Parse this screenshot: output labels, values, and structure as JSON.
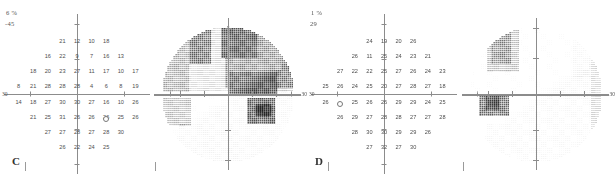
{
  "report": {
    "title": "Humphrey visual field greyscale and numeric threshold panels",
    "axis_label": "30",
    "colors": {
      "axis": "#8c8c8c",
      "text": "#4d4d4d",
      "background": "#ffffff"
    }
  },
  "panels": [
    {
      "id": "C",
      "label": "C",
      "header_percent": "6 %",
      "header_value": "-45",
      "numeric_chart": {
        "type": "table",
        "title": "Numeric threshold sensitivity grid (dB) - panel C",
        "axis_end_label": "30",
        "blind_spot": {
          "col": 6,
          "row": 5
        },
        "rows": [
          {
            "row": 0,
            "cells": [
              {
                "col": 3,
                "v": "21"
              },
              {
                "col": 4,
                "v": "12"
              },
              {
                "col": 5,
                "v": "10"
              },
              {
                "col": 6,
                "v": "18"
              }
            ]
          },
          {
            "row": 1,
            "cells": [
              {
                "col": 2,
                "v": "16"
              },
              {
                "col": 3,
                "v": "22"
              },
              {
                "col": 4,
                "v": "9"
              },
              {
                "col": 5,
                "v": "7"
              },
              {
                "col": 6,
                "v": "16"
              },
              {
                "col": 7,
                "v": "13"
              }
            ]
          },
          {
            "row": 2,
            "cells": [
              {
                "col": 1,
                "v": "18"
              },
              {
                "col": 2,
                "v": "20"
              },
              {
                "col": 3,
                "v": "23"
              },
              {
                "col": 4,
                "v": "27"
              },
              {
                "col": 5,
                "v": "11"
              },
              {
                "col": 6,
                "v": "17"
              },
              {
                "col": 7,
                "v": "10"
              },
              {
                "col": 8,
                "v": "17"
              }
            ]
          },
          {
            "row": 3,
            "cells": [
              {
                "col": 0,
                "v": "8"
              },
              {
                "col": 1,
                "v": "21"
              },
              {
                "col": 2,
                "v": "28"
              },
              {
                "col": 3,
                "v": "28"
              },
              {
                "col": 4,
                "v": "28"
              },
              {
                "col": 5,
                "v": "4"
              },
              {
                "col": 6,
                "v": "6"
              },
              {
                "col": 7,
                "v": "8"
              },
              {
                "col": 8,
                "v": "19"
              }
            ]
          },
          {
            "row": 4,
            "cells": [
              {
                "col": 0,
                "v": "14"
              },
              {
                "col": 1,
                "v": "18"
              },
              {
                "col": 2,
                "v": "27"
              },
              {
                "col": 3,
                "v": "30"
              },
              {
                "col": 4,
                "v": "30"
              },
              {
                "col": 5,
                "v": "27"
              },
              {
                "col": 6,
                "v": "16"
              },
              {
                "col": 7,
                "v": "10"
              },
              {
                "col": 8,
                "v": "26"
              }
            ]
          },
          {
            "row": 5,
            "cells": [
              {
                "col": 1,
                "v": "21"
              },
              {
                "col": 2,
                "v": "25"
              },
              {
                "col": 3,
                "v": "31"
              },
              {
                "col": 4,
                "v": "26"
              },
              {
                "col": 5,
                "v": "26"
              },
              {
                "col": 6,
                "v": "26"
              },
              {
                "col": 7,
                "v": "25"
              },
              {
                "col": 8,
                "v": "26"
              }
            ]
          },
          {
            "row": 6,
            "cells": [
              {
                "col": 2,
                "v": "27"
              },
              {
                "col": 3,
                "v": "27"
              },
              {
                "col": 4,
                "v": "28"
              },
              {
                "col": 5,
                "v": "27"
              },
              {
                "col": 6,
                "v": "28"
              },
              {
                "col": 7,
                "v": "30"
              }
            ]
          },
          {
            "row": 7,
            "cells": [
              {
                "col": 3,
                "v": "26"
              },
              {
                "col": 4,
                "v": "22"
              },
              {
                "col": 5,
                "v": "24"
              },
              {
                "col": 6,
                "v": "25"
              }
            ]
          }
        ]
      },
      "greyscale": {
        "type": "heatmap",
        "title": "Greyscale visual field map - panel C",
        "axis_end_label": "30",
        "description": "Dense dark defect across superior and superonasal field plus inferotemporal scotoma"
      }
    },
    {
      "id": "D",
      "label": "D",
      "header_percent": "1 %",
      "header_value": "29",
      "numeric_chart": {
        "type": "table",
        "title": "Numeric threshold sensitivity grid (dB) - panel D",
        "axis_end_label": "30",
        "blind_spot": {
          "col": 1,
          "row": 4
        },
        "rows": [
          {
            "row": 0,
            "cells": [
              {
                "col": 3,
                "v": "24"
              },
              {
                "col": 4,
                "v": "19"
              },
              {
                "col": 5,
                "v": "20"
              },
              {
                "col": 6,
                "v": "26"
              }
            ]
          },
          {
            "row": 1,
            "cells": [
              {
                "col": 2,
                "v": "26"
              },
              {
                "col": 3,
                "v": "11"
              },
              {
                "col": 4,
                "v": "25"
              },
              {
                "col": 5,
                "v": "24"
              },
              {
                "col": 6,
                "v": "23"
              },
              {
                "col": 7,
                "v": "21"
              }
            ]
          },
          {
            "row": 2,
            "cells": [
              {
                "col": 1,
                "v": "27"
              },
              {
                "col": 2,
                "v": "22"
              },
              {
                "col": 3,
                "v": "22"
              },
              {
                "col": 4,
                "v": "25"
              },
              {
                "col": 5,
                "v": "27"
              },
              {
                "col": 6,
                "v": "26"
              },
              {
                "col": 7,
                "v": "24"
              },
              {
                "col": 8,
                "v": "23"
              }
            ]
          },
          {
            "row": 3,
            "cells": [
              {
                "col": 0,
                "v": "25"
              },
              {
                "col": 1,
                "v": "26"
              },
              {
                "col": 2,
                "v": "24"
              },
              {
                "col": 3,
                "v": "25"
              },
              {
                "col": 4,
                "v": "20"
              },
              {
                "col": 5,
                "v": "27"
              },
              {
                "col": 6,
                "v": "28"
              },
              {
                "col": 7,
                "v": "27"
              },
              {
                "col": 8,
                "v": "18"
              }
            ]
          },
          {
            "row": 4,
            "cells": [
              {
                "col": 0,
                "v": "26"
              },
              {
                "col": 2,
                "v": "25"
              },
              {
                "col": 3,
                "v": "26"
              },
              {
                "col": 4,
                "v": "26"
              },
              {
                "col": 5,
                "v": "29"
              },
              {
                "col": 6,
                "v": "29"
              },
              {
                "col": 7,
                "v": "24"
              },
              {
                "col": 8,
                "v": "25"
              }
            ]
          },
          {
            "row": 5,
            "cells": [
              {
                "col": 1,
                "v": "26"
              },
              {
                "col": 2,
                "v": "29"
              },
              {
                "col": 3,
                "v": "27"
              },
              {
                "col": 4,
                "v": "28"
              },
              {
                "col": 5,
                "v": "28"
              },
              {
                "col": 6,
                "v": "27"
              },
              {
                "col": 7,
                "v": "27"
              },
              {
                "col": 8,
                "v": "28"
              }
            ]
          },
          {
            "row": 6,
            "cells": [
              {
                "col": 2,
                "v": "28"
              },
              {
                "col": 3,
                "v": "30"
              },
              {
                "col": 4,
                "v": "30"
              },
              {
                "col": 5,
                "v": "29"
              },
              {
                "col": 6,
                "v": "29"
              },
              {
                "col": 7,
                "v": "26"
              }
            ]
          },
          {
            "row": 7,
            "cells": [
              {
                "col": 3,
                "v": "27"
              },
              {
                "col": 4,
                "v": "32"
              },
              {
                "col": 5,
                "v": "27"
              },
              {
                "col": 6,
                "v": "30"
              }
            ]
          }
        ]
      },
      "greyscale": {
        "type": "heatmap",
        "title": "Greyscale visual field map - panel D",
        "axis_end_label": "30",
        "description": "Mostly normal light stipple with superonasal cluster and dense nasal-step scotoma near blind spot"
      }
    }
  ]
}
